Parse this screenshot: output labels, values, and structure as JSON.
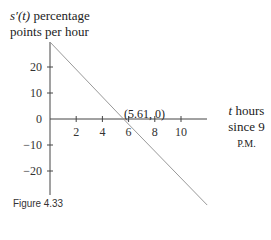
{
  "chart_data": {
    "type": "line",
    "title": "",
    "ylabel_func": "s′(t)",
    "ylabel_rest": " percentage",
    "ylabel_line2": "points per hour",
    "xlabel_var": "t",
    "xlabel_line1": " hours",
    "xlabel_line2_pre": "since 9 ",
    "xlabel_line2_sc": "P.M.",
    "x_ticks": [
      2,
      4,
      6,
      8,
      10
    ],
    "y_ticks": [
      20,
      10,
      0,
      -10,
      -20
    ],
    "xlim": [
      0,
      12
    ],
    "ylim": [
      -30,
      30
    ],
    "series": [
      {
        "name": "s'(t)",
        "x": [
          0,
          5.61,
          12
        ],
        "y": [
          29.6,
          0,
          -33.1
        ]
      }
    ],
    "annotation": "(5.61, 0)",
    "grid": false
  },
  "caption": "Figure 4.33"
}
